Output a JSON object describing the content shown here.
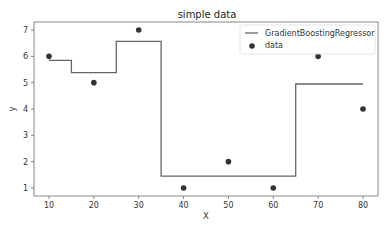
{
  "chart_data": {
    "type": "line",
    "title": "simple data",
    "xlabel": "X",
    "ylabel": "y",
    "xlim": [
      7,
      83.5
    ],
    "ylim": [
      0.7,
      7.3
    ],
    "grid": false,
    "legend_position": "upper right",
    "x_ticks": [
      10,
      20,
      30,
      40,
      50,
      60,
      70,
      80
    ],
    "y_ticks": [
      1,
      2,
      3,
      4,
      5,
      6,
      7
    ],
    "series": [
      {
        "name": "GradientBoostingRegressor",
        "kind": "step-line",
        "color": "#666666",
        "x": [
          10,
          15,
          15,
          25,
          25,
          35,
          35,
          65,
          65,
          80
        ],
        "values": [
          5.85,
          5.85,
          5.38,
          5.38,
          6.57,
          6.57,
          1.45,
          1.45,
          4.95,
          4.95
        ]
      },
      {
        "name": "data",
        "kind": "scatter",
        "color": "#333333",
        "x": [
          10,
          20,
          30,
          40,
          50,
          60,
          70,
          80
        ],
        "values": [
          6,
          5,
          7,
          1,
          2,
          1,
          6,
          4
        ]
      }
    ],
    "legend": [
      "GradientBoostingRegressor",
      "data"
    ]
  }
}
